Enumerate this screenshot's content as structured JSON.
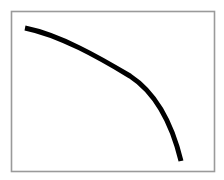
{
  "figure": {
    "name": "concave-curve-figure",
    "width": 224,
    "height": 180,
    "background_color": "#ffffff"
  },
  "frame": {
    "name": "plot-border",
    "x": 11.5,
    "y": 11.5,
    "width": 203,
    "height": 160,
    "stroke_color": "#9a9a9a",
    "stroke_width": 1.6,
    "fill_color": "#ffffff"
  },
  "chart_data": {
    "type": "line",
    "title": "",
    "subtitle": "",
    "xlabel": "",
    "ylabel": "",
    "grid": false,
    "legend": null,
    "axis_ticks": {
      "x": [],
      "y": []
    },
    "xlim": [
      11,
      215
    ],
    "ylim": [
      11,
      172
    ],
    "annotations": [],
    "series": [
      {
        "name": "curve",
        "color": "#000000",
        "stroke_width": 5,
        "linecap": "butt",
        "points": [
          [
            25,
            28
          ],
          [
            40,
            32
          ],
          [
            55,
            38
          ],
          [
            70,
            45
          ],
          [
            85,
            52
          ],
          [
            100,
            59
          ],
          [
            110,
            63
          ],
          [
            120,
            68
          ],
          [
            130,
            75
          ],
          [
            142,
            87
          ],
          [
            152,
            97
          ],
          [
            160,
            108
          ],
          [
            168,
            122
          ],
          [
            174,
            136
          ],
          [
            178,
            148
          ],
          [
            181,
            161
          ]
        ],
        "path": "M 25 28 C 60 35 100 58 130 76 C 156 93 172 124 181 161"
      }
    ]
  }
}
